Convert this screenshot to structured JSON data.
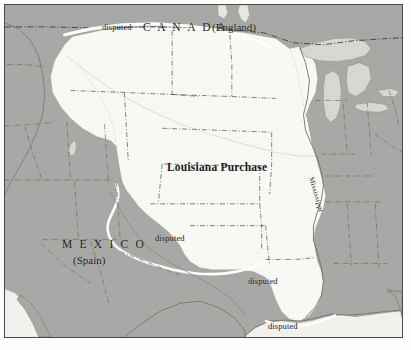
{
  "figure": {
    "kind": "historical-map",
    "title_visible": false
  },
  "colors": {
    "land": "#a9a9a6",
    "purchase_fill": "#f9f9f6",
    "lake_fill": "#d9d9d4",
    "border_line": "#4a4a4a",
    "state_line": "#5a5a57",
    "disputed_line": "#ffffff",
    "text": "#1c1c1c",
    "page": "#fdfdfb"
  },
  "labels": {
    "canada": "C A N A D A",
    "canada_parenthetical": "(England)",
    "mexico": "M E X I C O",
    "mexico_parenthetical": "(Spain)",
    "territory": "Louisiana Purchase",
    "river": "Mississippi",
    "disputed_north": "disputed",
    "disputed_west": "disputed",
    "disputed_south": "disputed",
    "disputed_gulf": "disputed"
  },
  "regions": [
    {
      "name": "Louisiana Purchase",
      "fill": "purchase_fill",
      "role": "acquired-territory"
    },
    {
      "name": "Canada (England)",
      "fill": "land",
      "role": "foreign-territory"
    },
    {
      "name": "Mexico (Spain)",
      "fill": "land",
      "role": "foreign-territory"
    },
    {
      "name": "United States (east of Mississippi)",
      "fill": "land",
      "role": "existing-nation"
    },
    {
      "name": "Great Lakes",
      "fill": "lake_fill",
      "role": "water"
    }
  ],
  "disputed_markers_count": 4
}
